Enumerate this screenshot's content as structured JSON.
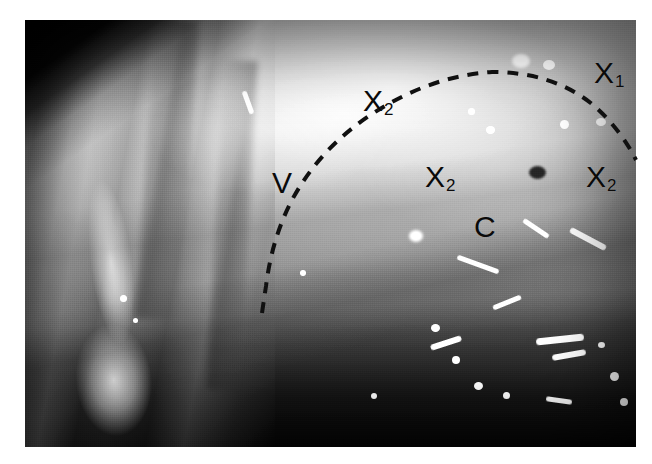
{
  "figure": {
    "kind": "endoscopic-photograph",
    "modality": "grayscale clinical photograph",
    "background_color": "#ffffff",
    "photo": {
      "x": 25,
      "y": 20,
      "width": 611,
      "height": 427,
      "tone_description": "bright glistening serosal surface upper right, pale mucosal folds left, dark shadowed recess along the lower edge"
    },
    "dashed_curve": {
      "stroke_color": "#101010",
      "stroke_width": 4,
      "dash_pattern": "11 9",
      "path": "M 262 313 L 266 286 Q 272 238 292 200 Q 320 148 372 114 Q 430 76 492 72 Q 552 72 592 104 Q 620 128 636 160",
      "description": "dashed line marking the demarcation between region V and regions X"
    }
  },
  "annotations": [
    {
      "id": "label-v",
      "text": "V",
      "sub": "",
      "x": 272,
      "y": 168
    },
    {
      "id": "label-x2-top",
      "text": "X",
      "sub": "2",
      "x": 363,
      "y": 86
    },
    {
      "id": "label-x1",
      "text": "X",
      "sub": "1",
      "x": 594,
      "y": 58
    },
    {
      "id": "label-x2-mid",
      "text": "X",
      "sub": "2",
      "x": 425,
      "y": 162
    },
    {
      "id": "label-x2-right",
      "text": "X",
      "sub": "2",
      "x": 586,
      "y": 162
    },
    {
      "id": "label-c",
      "text": "C",
      "sub": "",
      "x": 474,
      "y": 212
    }
  ],
  "highlights": {
    "glints": [
      {
        "x": 120,
        "y": 295,
        "w": 7,
        "h": 7
      },
      {
        "x": 133,
        "y": 318,
        "w": 5,
        "h": 5
      },
      {
        "x": 409,
        "y": 230,
        "w": 14,
        "h": 12
      },
      {
        "x": 300,
        "y": 270,
        "w": 6,
        "h": 6
      },
      {
        "x": 512,
        "y": 54,
        "w": 18,
        "h": 14
      },
      {
        "x": 543,
        "y": 60,
        "w": 12,
        "h": 10
      },
      {
        "x": 560,
        "y": 120,
        "w": 9,
        "h": 9
      },
      {
        "x": 596,
        "y": 118,
        "w": 10,
        "h": 8
      },
      {
        "x": 486,
        "y": 126,
        "w": 9,
        "h": 8
      },
      {
        "x": 468,
        "y": 108,
        "w": 7,
        "h": 7
      },
      {
        "x": 431,
        "y": 324,
        "w": 9,
        "h": 8
      },
      {
        "x": 452,
        "y": 356,
        "w": 8,
        "h": 8
      },
      {
        "x": 474,
        "y": 382,
        "w": 9,
        "h": 8
      },
      {
        "x": 503,
        "y": 392,
        "w": 7,
        "h": 7
      },
      {
        "x": 371,
        "y": 393,
        "w": 6,
        "h": 6
      },
      {
        "x": 610,
        "y": 372,
        "w": 9,
        "h": 9
      },
      {
        "x": 620,
        "y": 398,
        "w": 8,
        "h": 8
      },
      {
        "x": 598,
        "y": 342,
        "w": 7,
        "h": 6
      }
    ],
    "streaks": [
      {
        "x": 430,
        "y": 340,
        "w": 32,
        "h": 6,
        "rot": -18
      },
      {
        "x": 536,
        "y": 336,
        "w": 48,
        "h": 7,
        "rot": -6
      },
      {
        "x": 552,
        "y": 352,
        "w": 34,
        "h": 6,
        "rot": -10
      },
      {
        "x": 492,
        "y": 300,
        "w": 30,
        "h": 5,
        "rot": -22
      },
      {
        "x": 546,
        "y": 398,
        "w": 26,
        "h": 5,
        "rot": 8
      },
      {
        "x": 236,
        "y": 100,
        "w": 24,
        "h": 5,
        "rot": 70
      },
      {
        "x": 568,
        "y": 236,
        "w": 40,
        "h": 6,
        "rot": 28
      },
      {
        "x": 456,
        "y": 262,
        "w": 44,
        "h": 5,
        "rot": 20
      },
      {
        "x": 521,
        "y": 226,
        "w": 30,
        "h": 5,
        "rot": 34
      }
    ],
    "dark_spots": [
      {
        "x": 529,
        "y": 166,
        "w": 17,
        "h": 13
      }
    ]
  }
}
